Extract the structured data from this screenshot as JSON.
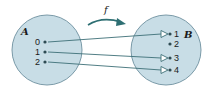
{
  "function_label": "f",
  "set_a": {
    "label": "A",
    "elements": [
      "0",
      "1",
      "2"
    ],
    "fill": "#c8dde6",
    "stroke": "#7a9aa8"
  },
  "set_b": {
    "label": "B",
    "elements": [
      "1",
      "2",
      "3",
      "4"
    ]
  },
  "mappings": [
    {
      "from": "0",
      "to": "1"
    },
    {
      "from": "1",
      "to": "3"
    },
    {
      "from": "2",
      "to": "4"
    }
  ],
  "colors": {
    "arrow": "#2e6f73",
    "circle_fill": "#c8dde6",
    "line": "#3d6f77"
  }
}
